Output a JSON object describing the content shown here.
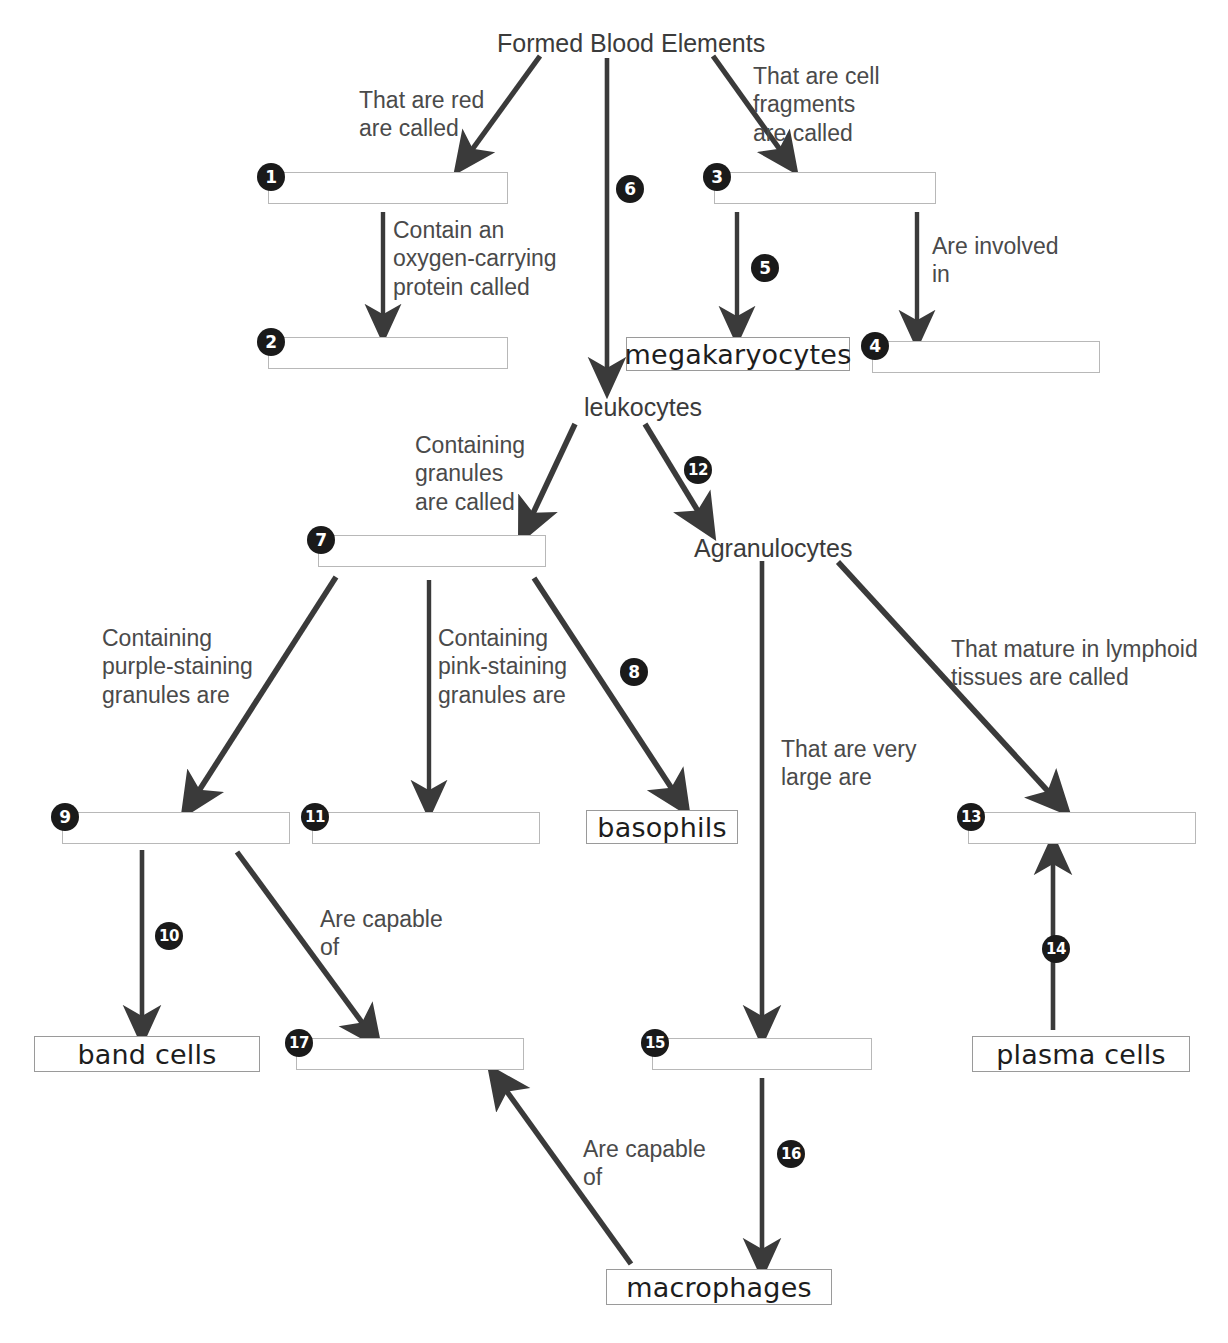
{
  "diagram": {
    "title": "Formed Blood Elements",
    "kind": "concept-map",
    "root_label": "Formed Blood Elements",
    "plain_nodes": [
      {
        "id": "root",
        "label": "Formed Blood Elements",
        "x": 497,
        "y": 30
      },
      {
        "id": "leukocytes",
        "label": "leukocytes",
        "x": 584,
        "y": 394
      },
      {
        "id": "agranulocytes",
        "label": "Agranulocytes",
        "x": 694,
        "y": 535
      }
    ],
    "answer_boxes": [
      {
        "number": "1",
        "x": 268,
        "y": 172,
        "w": 240,
        "h": 32
      },
      {
        "number": "2",
        "x": 268,
        "y": 337,
        "w": 240,
        "h": 32
      },
      {
        "number": "3",
        "x": 714,
        "y": 172,
        "w": 222,
        "h": 32
      },
      {
        "number": "4",
        "x": 872,
        "y": 341,
        "w": 228,
        "h": 32
      },
      {
        "number": "7",
        "x": 318,
        "y": 535,
        "w": 228,
        "h": 32
      },
      {
        "number": "9",
        "x": 62,
        "y": 812,
        "w": 228,
        "h": 32
      },
      {
        "number": "11",
        "x": 312,
        "y": 812,
        "w": 228,
        "h": 32
      },
      {
        "number": "13",
        "x": 968,
        "y": 812,
        "w": 228,
        "h": 32
      },
      {
        "number": "15",
        "x": 652,
        "y": 1038,
        "w": 220,
        "h": 32
      },
      {
        "number": "17",
        "x": 296,
        "y": 1038,
        "w": 228,
        "h": 32
      }
    ],
    "term_boxes": [
      {
        "id": "megakaryocytes",
        "label": "megakaryocytes",
        "x": 626,
        "y": 337,
        "w": 224,
        "h": 34
      },
      {
        "id": "basophils",
        "label": "basophils",
        "x": 586,
        "y": 810,
        "w": 152,
        "h": 34
      },
      {
        "id": "band-cells",
        "label": "band cells",
        "x": 34,
        "y": 1036,
        "w": 226,
        "h": 36
      },
      {
        "id": "plasma-cells",
        "label": "plasma cells",
        "x": 972,
        "y": 1036,
        "w": 218,
        "h": 36
      },
      {
        "id": "macrophages",
        "label": "macrophages",
        "x": 606,
        "y": 1269,
        "w": 226,
        "h": 36
      }
    ],
    "edge_labels": [
      {
        "id": "red-called",
        "text": "That are red\nare called",
        "x": 359,
        "y": 86
      },
      {
        "id": "cell-fragments",
        "text": "That are cell\nfragments\nare called",
        "x": 753,
        "y": 62
      },
      {
        "id": "oxygen-protein",
        "text": "Contain an\noxygen-carrying\nprotein called",
        "x": 393,
        "y": 216
      },
      {
        "id": "involved-in",
        "text": "Are involved\nin",
        "x": 932,
        "y": 232
      },
      {
        "id": "granules-called",
        "text": "Containing\ngranules\nare called",
        "x": 415,
        "y": 431
      },
      {
        "id": "purple-granules",
        "text": "Containing\npurple-staining\ngranules are",
        "x": 102,
        "y": 624
      },
      {
        "id": "pink-granules",
        "text": "Containing\npink-staining\ngranules are",
        "x": 438,
        "y": 624
      },
      {
        "id": "lymphoid-tissues",
        "text": "That mature in lymphoid\ntissues are called",
        "x": 951,
        "y": 635
      },
      {
        "id": "very-large",
        "text": "That are very\nlarge are",
        "x": 781,
        "y": 735
      },
      {
        "id": "capable-of-upper",
        "text": "Are capable\nof",
        "x": 320,
        "y": 905
      },
      {
        "id": "capable-of-lower",
        "text": "Are capable\nof",
        "x": 583,
        "y": 1135
      }
    ],
    "numbered_connectors": [
      {
        "number": "6",
        "x": 616,
        "y": 175
      },
      {
        "number": "5",
        "x": 751,
        "y": 254
      },
      {
        "number": "12",
        "x": 684,
        "y": 456
      },
      {
        "number": "8",
        "x": 620,
        "y": 658
      },
      {
        "number": "10",
        "x": 155,
        "y": 922
      },
      {
        "number": "14",
        "x": 1042,
        "y": 935
      },
      {
        "number": "16",
        "x": 777,
        "y": 1140
      }
    ],
    "edges": [
      {
        "from": "root",
        "to": "1",
        "style": "diagonal-arrow"
      },
      {
        "from": "root",
        "to": "leukocytes",
        "style": "vertical-arrow",
        "number": "6"
      },
      {
        "from": "root",
        "to": "3",
        "style": "diagonal-arrow"
      },
      {
        "from": "1",
        "to": "2",
        "style": "vertical-arrow"
      },
      {
        "from": "3",
        "to": "megakaryocytes",
        "style": "vertical-arrow",
        "number": "5"
      },
      {
        "from": "3",
        "to": "4",
        "style": "vertical-arrow"
      },
      {
        "from": "leukocytes",
        "to": "7",
        "style": "diagonal-arrow"
      },
      {
        "from": "leukocytes",
        "to": "agranulocytes",
        "style": "diagonal-arrow",
        "number": "12"
      },
      {
        "from": "7",
        "to": "9",
        "style": "diagonal-arrow"
      },
      {
        "from": "7",
        "to": "11",
        "style": "vertical-arrow"
      },
      {
        "from": "7",
        "to": "basophils",
        "style": "diagonal-arrow",
        "number": "8"
      },
      {
        "from": "9",
        "to": "band-cells",
        "style": "vertical-arrow",
        "number": "10"
      },
      {
        "from": "9",
        "to": "17",
        "style": "diagonal-arrow"
      },
      {
        "from": "agranulocytes",
        "to": "15",
        "style": "vertical-arrow"
      },
      {
        "from": "agranulocytes",
        "to": "13",
        "style": "diagonal-arrow"
      },
      {
        "from": "15",
        "to": "macrophages",
        "style": "vertical-arrow",
        "number": "16"
      },
      {
        "from": "macrophages",
        "to": "17",
        "style": "diagonal-arrow"
      },
      {
        "from": "plasma-cells",
        "to": "13",
        "style": "vertical-arrow",
        "number": "14"
      }
    ],
    "colors": {
      "stroke": "#3a3a3a",
      "badge_fill": "#1a1a1a",
      "badge_text": "#ffffff",
      "box_border": "#9a9a9a",
      "text": "#3b3b3b",
      "background": "#ffffff"
    }
  }
}
